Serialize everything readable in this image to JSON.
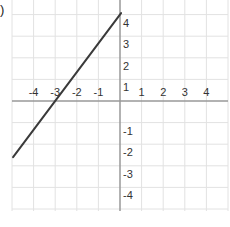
{
  "chart_data": {
    "type": "line",
    "title": "",
    "xlabel": "",
    "ylabel": "",
    "xlim": [
      -5,
      5
    ],
    "ylim": [
      -5,
      4.5
    ],
    "grid": true,
    "x_ticks": [
      -4,
      -3,
      -2,
      -1,
      1,
      2,
      3,
      4
    ],
    "y_ticks": [
      4,
      3,
      2,
      1,
      -1,
      -2,
      -3,
      -4
    ],
    "x_tick_labels": [
      "-4",
      "-3",
      "-2",
      "-1",
      "1",
      "2",
      "3",
      "4"
    ],
    "y_tick_labels": [
      "4",
      "3",
      "2",
      "1",
      "-1",
      "-2",
      "-3",
      "-4"
    ],
    "series": [
      {
        "name": "line",
        "equation": "y = (4/3)x + 4",
        "points": [
          {
            "x": -5,
            "y": -2.67
          },
          {
            "x": -3,
            "y": 0
          },
          {
            "x": 0,
            "y": 4
          }
        ],
        "color": "#3a3a3a"
      }
    ],
    "colors": {
      "grid": "#e2e2e2",
      "axis": "#999999",
      "line": "#3a3a3a",
      "text": "#333333"
    }
  },
  "partial_label": ")"
}
